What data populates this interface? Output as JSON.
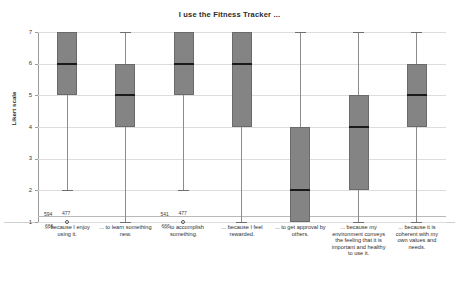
{
  "chart_data": {
    "type": "box",
    "title": "I use the Fitness Tracker ...",
    "xlabel": "",
    "ylabel": "Likert scale",
    "ylim": [
      1,
      7
    ],
    "yticks": [
      1,
      2,
      3,
      4,
      5,
      6,
      7
    ],
    "grid": true,
    "legend": null,
    "categories": [
      "... because I enjoy using it.",
      "... to learn something new.",
      "... to accomplish something.",
      "... because I feel rewarded.",
      "... to get approval by others.",
      "... because my environment conveys the feeling that it is important and healthy to use it.",
      "... because it is coherent with my own values and needs."
    ],
    "boxes": [
      {
        "category": "... because I enjoy using it.",
        "whisker_low": 2,
        "q1": 5,
        "median": 6,
        "q3": 7,
        "whisker_high": 7
      },
      {
        "category": "... to learn something new.",
        "whisker_low": 1,
        "q1": 4,
        "median": 5,
        "q3": 6,
        "whisker_high": 7
      },
      {
        "category": "... to accomplish something.",
        "whisker_low": 2,
        "q1": 5,
        "median": 6,
        "q3": 7,
        "whisker_high": 7
      },
      {
        "category": "... because I feel rewarded.",
        "whisker_low": 1,
        "q1": 4,
        "median": 6,
        "q3": 7,
        "whisker_high": 7
      },
      {
        "category": "... to get approval by others.",
        "whisker_low": 1,
        "q1": 1,
        "median": 2,
        "q3": 4,
        "whisker_high": 7
      },
      {
        "category": "... because my environment conveys the feeling that it is important and healthy to use it.",
        "whisker_low": 1,
        "q1": 2,
        "median": 4,
        "q3": 5,
        "whisker_high": 7
      },
      {
        "category": "... because it is coherent with my own values and needs.",
        "whisker_low": 1,
        "q1": 4,
        "median": 5,
        "q3": 6,
        "whisker_high": 7
      }
    ],
    "outliers": [
      {
        "box_index": 0,
        "value": 1,
        "ids": [
          "594",
          "477",
          "666"
        ]
      },
      {
        "box_index": 2,
        "value": 1,
        "ids": [
          "541",
          "477",
          "666"
        ]
      }
    ],
    "colors": {
      "box_fill": "#848484",
      "box_edge": "#6a6a6a",
      "median": "#1a1a1a",
      "whisker": "#8c8c8c",
      "grid": "#dddddd",
      "axis": "#9a9a9a",
      "background": "#ffffff"
    }
  },
  "annotations": {
    "group_1": {
      "top_left": "594",
      "top_right": "477",
      "bottom": "666"
    },
    "group_2": {
      "top_left": "541",
      "top_right": "477",
      "bottom": "666"
    }
  }
}
